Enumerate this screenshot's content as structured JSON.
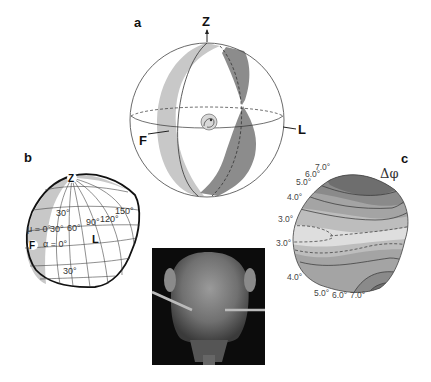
{
  "panel_a": {
    "letter": "a",
    "axes": {
      "z": "Z",
      "f": "F",
      "l": "L"
    },
    "colors": {
      "light_band": "#c8c8c8",
      "dark_band": "#8c8c8c",
      "outline": "#333333"
    }
  },
  "panel_b": {
    "letter": "b",
    "pole_label": "Z",
    "f_label": "F",
    "l_label": "L",
    "labels": {
      "lat_30_top": "30°",
      "mu": "μ = 0°",
      "lon_30": "30°",
      "lon_60": "60°",
      "lon_90": "90°",
      "lon_120": "120°",
      "lon_150": "150°",
      "alpha": "α = 0°",
      "lat_30_bottom": "30°"
    },
    "colors": {
      "band": "#c8c8c8",
      "outline": "#111111"
    }
  },
  "panel_c": {
    "letter": "c",
    "quantity": "Δφ",
    "contour_labels_top": [
      "7.0°",
      "6.0°",
      "5.0°",
      "4.0°",
      "3.0°"
    ],
    "contour_labels_bottom": [
      "3.0°",
      "4.0°",
      "5.0°",
      "6.0°",
      "7.0°"
    ],
    "colors": {
      "darkest": "#6e6e6e",
      "dark": "#8a8a8a",
      "mid": "#a4a4a4",
      "light": "#bdbdbd",
      "lightest": "#dedede"
    }
  },
  "photo": {
    "description": "SEM image of ant head with antennae",
    "background": "#0c0c0c"
  }
}
